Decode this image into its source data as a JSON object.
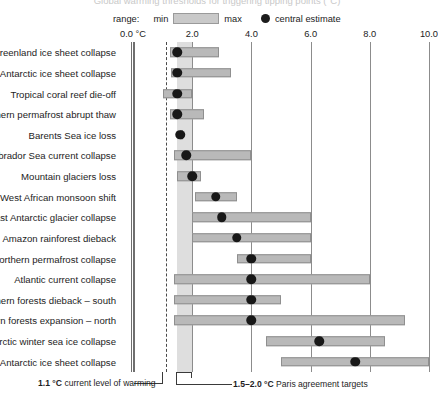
{
  "title_partial": "Global warming thresholds for triggering tipping points (°C)",
  "legend": {
    "range_label": "range:",
    "min_label": "min",
    "max_label": "max",
    "central_label": "central estimate",
    "swatch_color": "#c9c9c9",
    "dot_color": "#1c1c1c"
  },
  "annotations": {
    "current_warming_value": "1.1 °C",
    "current_warming_text": "current level of warming",
    "paris_value": "1.5–2.0 °C",
    "paris_text": "Paris agreement targets"
  },
  "chart_data": {
    "type": "bar",
    "title": "Global warming thresholds for triggering tipping points (°C)",
    "xlabel": "°C",
    "ylabel": "",
    "xlim": [
      0.0,
      10.0
    ],
    "xticks": [
      0.0,
      2.0,
      4.0,
      6.0,
      8.0,
      10.0
    ],
    "xtick_labels": [
      "0.0 °C",
      "2.0",
      "4.0",
      "6.0",
      "8.0",
      "10.0"
    ],
    "grid": "vertical",
    "legend_position": "top",
    "reference_lines": [
      {
        "name": "current-warming",
        "value": 1.1,
        "style": "dashed"
      }
    ],
    "reference_bands": [
      {
        "name": "paris-targets",
        "from": 1.5,
        "to": 2.0,
        "color": "#d8d8d8"
      }
    ],
    "categories": [
      "Greenland ice sheet collapse",
      "West Antarctic ice sheet collapse",
      "Tropical coral reef die-off",
      "Northern permafrost abrupt thaw",
      "Barents Sea ice loss",
      "Labrador Sea current collapse",
      "Mountain glaciers loss",
      "West African monsoon shift",
      "East Antarctic glacier collapse",
      "Amazon rainforest dieback",
      "Northern permafrost collapse",
      "Atlantic current collapse",
      "Northern forests dieback – south",
      "Northern forests expansion – north",
      "Arctic winter sea ice collapse",
      "East Antarctic ice sheet collapse"
    ],
    "series": [
      {
        "name": "min",
        "values": [
          1.25,
          1.3,
          1.0,
          1.25,
          1.6,
          1.4,
          1.5,
          2.1,
          2.0,
          2.0,
          3.5,
          1.4,
          1.4,
          1.4,
          4.5,
          5.0
        ]
      },
      {
        "name": "max",
        "values": [
          2.9,
          3.3,
          2.0,
          2.4,
          1.7,
          4.0,
          2.3,
          3.5,
          6.0,
          6.0,
          6.0,
          8.0,
          5.0,
          9.2,
          8.5,
          10.0
        ]
      },
      {
        "name": "central estimate",
        "values": [
          1.5,
          1.5,
          1.5,
          1.5,
          1.6,
          1.8,
          2.0,
          2.8,
          3.0,
          3.5,
          4.0,
          4.0,
          4.0,
          4.0,
          6.3,
          7.5
        ]
      }
    ]
  }
}
